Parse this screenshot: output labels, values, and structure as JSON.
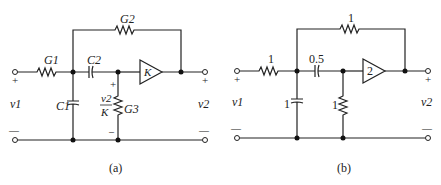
{
  "circuits": [
    {
      "id": "a",
      "caption": "(a)",
      "input_label": "v1",
      "output_label": "v2",
      "plus": "+",
      "minus": "—",
      "components": {
        "series_resistor": "G1",
        "feedback_resistor": "G2",
        "shunt_capacitor": "C1",
        "series_capacitor": "C2",
        "shunt_resistor": "G3",
        "amplifier_gain": "K",
        "node_voltage_num": "v2",
        "node_voltage_den": "K"
      }
    },
    {
      "id": "b",
      "caption": "(b)",
      "input_label": "v1",
      "output_label": "v2",
      "plus": "+",
      "minus": "—",
      "components": {
        "series_resistor": "1",
        "feedback_resistor": "1",
        "shunt_capacitor": "1",
        "series_capacitor": "0.5",
        "shunt_resistor": "1",
        "amplifier_gain": "2"
      }
    }
  ]
}
